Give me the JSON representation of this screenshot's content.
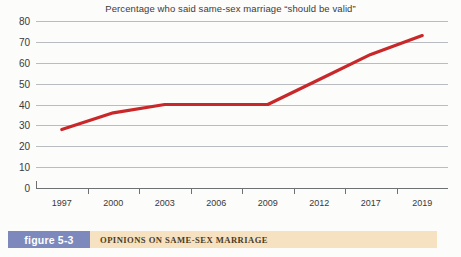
{
  "figure": {
    "badge_label": "figure 5-3",
    "caption": "OPINIONS ON SAME-SEX MARRIAGE",
    "badge_color": "#7d89bd",
    "caption_bar_color": "#f6e2c0"
  },
  "chart_data": {
    "type": "line",
    "title": "Percentage who said same-sex marriage “should be valid”",
    "xlabel": "Year",
    "ylabel": "",
    "categories": [
      "1997",
      "2000",
      "2003",
      "2006",
      "2009",
      "2012",
      "2017",
      "2019"
    ],
    "values": [
      28,
      36,
      40,
      40,
      40,
      52,
      64,
      73
    ],
    "yticks": [
      0,
      10,
      20,
      30,
      40,
      50,
      60,
      70,
      80
    ],
    "ylim": [
      0,
      80
    ],
    "grid": true,
    "legend": "none",
    "series_color": "#c9282a",
    "gridline_color": "#b9bcc0",
    "axis_color": "#6e7074"
  }
}
